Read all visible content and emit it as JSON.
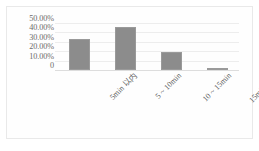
{
  "chart_data": {
    "type": "bar",
    "title": "",
    "subtitle": "",
    "xlabel": "",
    "ylabel": "",
    "categories": [
      "5min 以内",
      "5 ~ 10min",
      "10 ~ 15min",
      "15min 以上"
    ],
    "values": [
      33.0,
      46.0,
      19.0,
      2.0
    ],
    "value_format": "percent",
    "ylim": [
      0,
      55
    ],
    "ytick_values": [
      0,
      10,
      20,
      30,
      40,
      50
    ],
    "ytick_labels": [
      "0",
      "10.00%",
      "20.00%",
      "30.00%",
      "40.00%",
      "50.00%"
    ],
    "grid": true,
    "legend": false,
    "legend_position": "none",
    "series": [
      {
        "name": "",
        "values": [
          33.0,
          46.0,
          19.0,
          2.0
        ]
      }
    ],
    "colors": {
      "bar": "#8c8c8c",
      "bar_border": "#9a9a9a",
      "gridline": "#ededed",
      "axis": "#dddddd",
      "tick_text": "#6b6b6b",
      "category_text": "#5f5f5f",
      "frame_border": "#e9e9e9",
      "background": "#ffffff"
    }
  }
}
